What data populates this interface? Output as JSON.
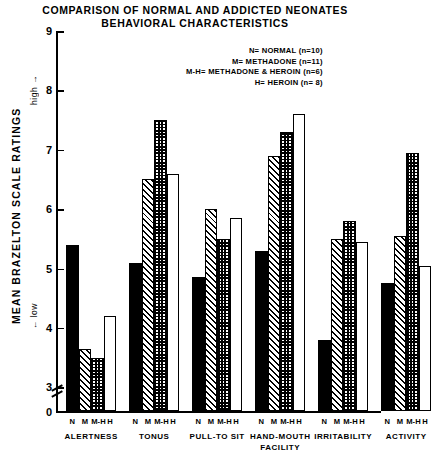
{
  "title": {
    "line1": "COMPARISON OF NORMAL AND ADDICTED NEONATES",
    "line2": "BEHAVIORAL CHARACTERISTICS"
  },
  "axis": {
    "y_caption": "MEAN  BRAZELTON  SCALE  RATINGS",
    "y_high": "high →",
    "y_low": "← low",
    "y_ticks": [
      "9",
      "8",
      "7",
      "6",
      "5",
      "4",
      "3",
      "0"
    ]
  },
  "legend": {
    "entries": [
      "N= NORMAL (n=10)",
      "M= METHADONE  (n=11)",
      "M-H= METHADONE & HEROIN (n=6)",
      "H= HEROIN (n= 8)"
    ]
  },
  "series_tick_labels": [
    "N",
    "M",
    "M-H",
    "H"
  ],
  "chart_data": {
    "type": "bar",
    "title": "COMPARISON OF NORMAL AND ADDICTED NEONATES BEHAVIORAL CHARACTERISTICS",
    "xlabel": "",
    "ylabel": "MEAN BRAZELTON SCALE RATINGS",
    "ylim": [
      0,
      9
    ],
    "y_ticks": [
      3,
      4,
      5,
      6,
      7,
      8,
      9
    ],
    "y_axis_break": true,
    "y_axis_break_between": [
      0,
      3
    ],
    "grid": false,
    "legend_position": "top-right",
    "categories": [
      "ALERTNESS",
      "TONUS",
      "PULL-TO SIT",
      "HAND-MOUTH FACILITY",
      "IRRITABILITY",
      "ACTIVITY"
    ],
    "series": [
      {
        "name": "N",
        "label": "NORMAL",
        "n": 10,
        "fill": "solid-black",
        "values": [
          5.4,
          5.1,
          4.85,
          5.3,
          3.8,
          4.75
        ]
      },
      {
        "name": "M",
        "label": "METHADONE",
        "n": 11,
        "fill": "diagonal-hatch",
        "values": [
          3.65,
          6.5,
          6.0,
          6.9,
          5.5,
          5.55
        ]
      },
      {
        "name": "M-H",
        "label": "METHADONE & HEROIN",
        "n": 6,
        "fill": "checkerboard",
        "values": [
          3.5,
          7.5,
          5.5,
          7.3,
          5.8,
          6.95
        ]
      },
      {
        "name": "H",
        "label": "HEROIN",
        "n": 8,
        "fill": "open-white",
        "values": [
          4.2,
          6.6,
          5.85,
          7.6,
          5.45,
          5.05
        ]
      }
    ]
  }
}
